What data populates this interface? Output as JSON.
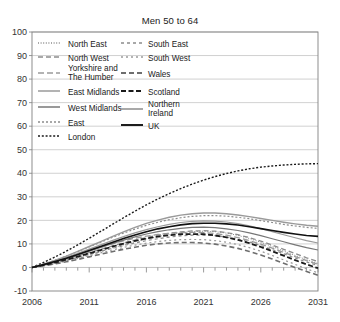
{
  "chart_data": {
    "type": "line",
    "title": "Men 50 to 64",
    "xlabel": "",
    "ylabel": "",
    "xlim": [
      2006,
      2031
    ],
    "ylim": [
      -10,
      100
    ],
    "ytick_values": [
      -10,
      0,
      10,
      20,
      30,
      40,
      50,
      60,
      70,
      80,
      90,
      100
    ],
    "ytick_labels": [
      "-10",
      "0",
      "10",
      "20",
      "30",
      "40",
      "50",
      "60",
      "70",
      "80",
      "90",
      "100"
    ],
    "xtick_values": [
      2006,
      2011,
      2016,
      2021,
      2026,
      2031
    ],
    "xtick_labels": [
      "2006",
      "2011",
      "2016",
      "2021",
      "2026",
      "2031"
    ],
    "x": [
      2006,
      2007,
      2008,
      2009,
      2010,
      2011,
      2012,
      2013,
      2014,
      2015,
      2016,
      2017,
      2018,
      2019,
      2020,
      2021,
      2022,
      2023,
      2024,
      2025,
      2026,
      2027,
      2028,
      2029,
      2030,
      2031
    ],
    "grid": "horizontal",
    "legend_position": "inside-upper-left",
    "legend_columns": 2,
    "series": [
      {
        "name": "North East",
        "style": "fine-dotted",
        "color": "#8c8c8c",
        "width": 1.0,
        "dash": "1,1.6",
        "values": [
          0,
          1.0,
          2.0,
          3.1,
          4.2,
          5.4,
          6.8,
          8.2,
          9.6,
          10.9,
          12.1,
          13.1,
          14.0,
          14.7,
          15.2,
          15.4,
          15.2,
          14.6,
          13.6,
          12.3,
          10.7,
          8.9,
          7.0,
          5.1,
          3.3,
          1.7
        ]
      },
      {
        "name": "North West",
        "style": "dashed",
        "color": "#8c8c8c",
        "width": 1.3,
        "dash": "5,3",
        "values": [
          0,
          1.1,
          2.3,
          3.6,
          4.9,
          6.3,
          7.7,
          9.1,
          10.4,
          11.6,
          12.7,
          13.7,
          14.5,
          15.1,
          15.5,
          15.6,
          15.4,
          14.8,
          13.9,
          12.7,
          11.2,
          9.5,
          7.7,
          5.9,
          4.1,
          2.5
        ]
      },
      {
        "name": "Yorkshire and The Humber",
        "style": "long-dashed",
        "color": "#9a9a9a",
        "width": 1.3,
        "dash": "6,3",
        "values": [
          0,
          1.2,
          2.5,
          4.0,
          5.5,
          7.1,
          8.6,
          10.0,
          11.3,
          12.4,
          13.3,
          14.0,
          14.5,
          14.8,
          14.9,
          14.8,
          14.4,
          13.7,
          12.7,
          11.4,
          9.9,
          8.2,
          6.4,
          4.6,
          2.9,
          1.4
        ]
      },
      {
        "name": "East Midlands",
        "style": "solid",
        "color": "#9a9a9a",
        "width": 1.2,
        "dash": "",
        "values": [
          0,
          1.3,
          2.7,
          4.3,
          6.0,
          7.8,
          9.6,
          11.4,
          13.1,
          14.7,
          16.1,
          17.3,
          18.3,
          19.1,
          19.6,
          19.8,
          19.7,
          19.3,
          18.6,
          17.7,
          16.5,
          15.2,
          13.9,
          12.6,
          11.4,
          10.4
        ]
      },
      {
        "name": "West Midlands",
        "style": "solid",
        "color": "#777777",
        "width": 1.2,
        "dash": "",
        "values": [
          0,
          1.1,
          2.4,
          3.8,
          5.3,
          6.9,
          8.5,
          10.1,
          11.6,
          13.0,
          14.2,
          15.2,
          16.0,
          16.6,
          17.0,
          17.1,
          16.9,
          16.4,
          15.7,
          14.7,
          13.5,
          12.2,
          10.9,
          9.6,
          8.4,
          7.4
        ]
      },
      {
        "name": "East",
        "style": "dotted",
        "color": "#8c8c8c",
        "width": 1.2,
        "dash": "2,2",
        "values": [
          0,
          1.4,
          3.0,
          4.8,
          6.7,
          8.7,
          10.7,
          12.7,
          14.6,
          16.3,
          17.9,
          19.2,
          20.3,
          21.1,
          21.7,
          22.0,
          22.0,
          21.8,
          21.3,
          20.7,
          19.9,
          19.1,
          18.3,
          17.6,
          17.0,
          16.6
        ]
      },
      {
        "name": "London",
        "style": "dotted",
        "color": "#1a1a1a",
        "width": 1.4,
        "dash": "2,1.8",
        "values": [
          0,
          2.1,
          4.4,
          6.9,
          9.6,
          12.4,
          15.3,
          18.2,
          21.1,
          23.9,
          26.6,
          29.1,
          31.4,
          33.5,
          35.4,
          37.1,
          38.6,
          39.9,
          41.0,
          41.9,
          42.6,
          43.1,
          43.5,
          43.8,
          44.0,
          44.1
        ]
      },
      {
        "name": "South East",
        "style": "dashed-sparse",
        "color": "#8c8c8c",
        "width": 1.2,
        "dash": "3,3",
        "values": [
          0,
          0.9,
          1.9,
          3.0,
          4.2,
          5.5,
          6.8,
          8.1,
          9.3,
          10.4,
          11.4,
          12.2,
          12.9,
          13.4,
          13.7,
          13.8,
          13.5,
          12.9,
          12.0,
          10.8,
          9.3,
          7.6,
          5.8,
          4.0,
          2.3,
          0.8
        ]
      },
      {
        "name": "South West",
        "style": "dotted-sparse",
        "color": "#9a9a9a",
        "width": 1.2,
        "dash": "2,3",
        "values": [
          0,
          0.8,
          1.7,
          2.7,
          3.8,
          5.0,
          6.2,
          7.4,
          8.5,
          9.5,
          10.3,
          11.0,
          11.5,
          11.8,
          11.9,
          11.8,
          11.4,
          10.7,
          9.7,
          8.4,
          6.9,
          5.1,
          3.2,
          1.3,
          -0.6,
          -2.3
        ]
      },
      {
        "name": "Wales",
        "style": "dashed",
        "color": "#6e6e6e",
        "width": 1.6,
        "dash": "5,3",
        "values": [
          0,
          0.7,
          1.5,
          2.4,
          3.4,
          4.5,
          5.6,
          6.7,
          7.7,
          8.6,
          9.4,
          10.0,
          10.4,
          10.6,
          10.6,
          10.4,
          9.9,
          9.1,
          8.1,
          6.8,
          5.3,
          3.6,
          1.8,
          0.0,
          -1.7,
          -3.3
        ]
      },
      {
        "name": "Scotland",
        "style": "dashed-bold",
        "color": "#1a1a1a",
        "width": 1.8,
        "dash": "5,2.5",
        "values": [
          0,
          1.0,
          2.1,
          3.3,
          4.6,
          6.0,
          7.4,
          8.8,
          10.1,
          11.3,
          12.3,
          13.1,
          13.7,
          14.1,
          14.2,
          14.1,
          13.6,
          12.8,
          11.7,
          10.3,
          8.7,
          6.9,
          5.0,
          3.1,
          1.3,
          -0.3
        ]
      },
      {
        "name": "Northern Ireland",
        "style": "solid",
        "color": "#9a9a9a",
        "width": 1.4,
        "dash": "",
        "values": [
          0,
          1.4,
          3.0,
          4.8,
          6.8,
          8.9,
          11.0,
          13.1,
          15.1,
          17.0,
          18.7,
          20.1,
          21.3,
          22.2,
          22.8,
          23.1,
          23.1,
          22.8,
          22.3,
          21.6,
          20.8,
          20.0,
          19.2,
          18.5,
          17.9,
          17.5
        ]
      },
      {
        "name": "UK",
        "style": "solid-bold",
        "color": "#111111",
        "width": 1.6,
        "dash": "",
        "values": [
          0,
          1.2,
          2.5,
          3.9,
          5.5,
          7.2,
          8.9,
          10.6,
          12.3,
          13.8,
          15.2,
          16.4,
          17.3,
          18.1,
          18.6,
          18.8,
          18.8,
          18.5,
          18.0,
          17.3,
          16.5,
          15.7,
          14.9,
          14.2,
          13.6,
          13.2
        ]
      }
    ]
  },
  "legend": {
    "left_column": [
      {
        "label": "North East",
        "series_index": 0
      },
      {
        "label": "North West",
        "series_index": 1
      },
      {
        "label": "Yorkshire and The Humber",
        "series_index": 2
      },
      {
        "label": "East Midlands",
        "series_index": 3
      },
      {
        "label": "West Midlands",
        "series_index": 4
      },
      {
        "label": "East",
        "series_index": 5
      },
      {
        "label": "London",
        "series_index": 6
      }
    ],
    "right_column": [
      {
        "label": "South East",
        "series_index": 7
      },
      {
        "label": "South West",
        "series_index": 8
      },
      {
        "label": "Wales",
        "series_index": 9
      },
      {
        "label": "Scotland",
        "series_index": 10
      },
      {
        "label": "Northern Ireland",
        "series_index": 11
      },
      {
        "label": "UK",
        "series_index": 12
      }
    ]
  },
  "colors": {
    "background": "#ffffff",
    "axis": "#808080",
    "grid": "#bdbdbd",
    "text": "#1a1a1a"
  }
}
